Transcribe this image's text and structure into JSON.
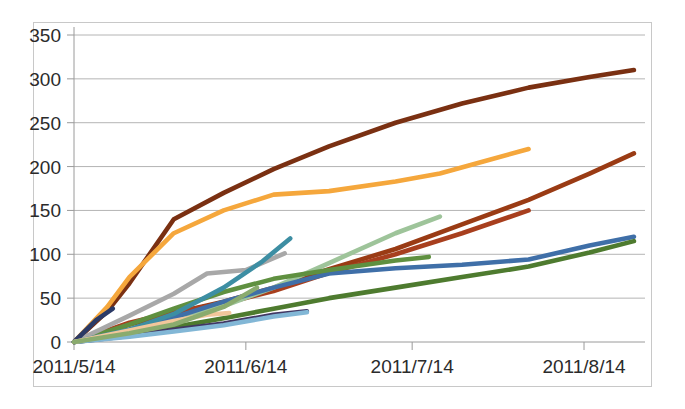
{
  "chart_data": {
    "type": "line",
    "title": "",
    "subtitle": "",
    "xlabel": "",
    "ylabel": "",
    "legend": "none",
    "grid": true,
    "x_tick_labels": [
      "2011/5/14",
      "2011/6/14",
      "2011/7/14",
      "2011/8/14"
    ],
    "x_tick_days": [
      0,
      31,
      61,
      92
    ],
    "xlim_days": [
      0,
      103
    ],
    "y_tick_labels": [
      "0",
      "50",
      "100",
      "150",
      "200",
      "250",
      "300",
      "350"
    ],
    "y_ticks": [
      0,
      50,
      100,
      150,
      200,
      250,
      300,
      350
    ],
    "ylim": [
      0,
      350
    ],
    "series": [
      {
        "name": "series-1-dark-brown",
        "color": "#7a3012",
        "x": [
          0,
          6,
          10,
          18,
          27,
          36,
          46,
          58,
          70,
          82,
          93,
          101
        ],
        "values": [
          0,
          35,
          67,
          140,
          170,
          197,
          223,
          250,
          272,
          290,
          302,
          310
        ]
      },
      {
        "name": "series-2-orange",
        "color": "#f5a73c",
        "x": [
          0,
          6,
          10,
          18,
          27,
          36,
          46,
          58,
          66,
          74,
          82
        ],
        "values": [
          0,
          40,
          74,
          124,
          150,
          168,
          172,
          183,
          192,
          206,
          220
        ]
      },
      {
        "name": "series-3-medium-brown",
        "color": "#9a3b14",
        "x": [
          0,
          10,
          18,
          27,
          36,
          46,
          58,
          70,
          82,
          93,
          101
        ],
        "values": [
          0,
          20,
          33,
          46,
          62,
          83,
          106,
          134,
          162,
          192,
          215
        ]
      },
      {
        "name": "series-4-red-brown",
        "color": "#a83f1e",
        "x": [
          0,
          10,
          18,
          27,
          36,
          46,
          58,
          70,
          82
        ],
        "values": [
          0,
          22,
          34,
          44,
          58,
          79,
          100,
          124,
          150
        ]
      },
      {
        "name": "series-5-light-green",
        "color": "#9ec49a",
        "x": [
          0,
          10,
          18,
          27,
          36,
          46,
          58,
          66
        ],
        "values": [
          0,
          14,
          26,
          41,
          62,
          90,
          124,
          143
        ]
      },
      {
        "name": "series-6-steel-blue",
        "color": "#3f6fa8",
        "x": [
          0,
          10,
          18,
          27,
          36,
          46,
          58,
          70,
          82,
          93,
          101
        ],
        "values": [
          0,
          14,
          28,
          46,
          62,
          78,
          84,
          88,
          94,
          110,
          120
        ]
      },
      {
        "name": "series-7-dark-green",
        "color": "#4e7b2f",
        "x": [
          0,
          10,
          18,
          27,
          36,
          46,
          58,
          70,
          82,
          93,
          101
        ],
        "values": [
          0,
          8,
          17,
          27,
          38,
          50,
          62,
          74,
          86,
          102,
          115
        ]
      },
      {
        "name": "series-8-medium-green",
        "color": "#5f9040",
        "x": [
          0,
          10,
          18,
          27,
          36,
          46,
          58,
          64
        ],
        "values": [
          0,
          20,
          38,
          57,
          72,
          82,
          93,
          97
        ]
      },
      {
        "name": "series-9-gray",
        "color": "#a8a8a8",
        "x": [
          0,
          10,
          18,
          24,
          31,
          38
        ],
        "values": [
          0,
          30,
          55,
          78,
          82,
          101
        ]
      },
      {
        "name": "series-10-teal",
        "color": "#3d8ea3",
        "x": [
          0,
          10,
          18,
          27,
          34,
          39
        ],
        "values": [
          0,
          14,
          32,
          62,
          92,
          118
        ]
      },
      {
        "name": "series-11-dark-navy",
        "color": "#2b3a66",
        "x": [
          0,
          4,
          7
        ],
        "values": [
          0,
          25,
          38
        ]
      },
      {
        "name": "series-12-purple",
        "color": "#413763",
        "x": [
          0,
          10,
          18,
          27,
          36,
          42
        ],
        "values": [
          0,
          7,
          14,
          21,
          31,
          35
        ]
      },
      {
        "name": "series-13-light-blue",
        "color": "#82b7d6",
        "x": [
          0,
          10,
          18,
          27,
          36,
          42
        ],
        "values": [
          0,
          6,
          12,
          19,
          29,
          34
        ]
      },
      {
        "name": "series-14-peach",
        "color": "#f2c69b",
        "x": [
          0,
          10,
          18,
          24,
          28
        ],
        "values": [
          0,
          13,
          24,
          31,
          33
        ]
      },
      {
        "name": "series-15-sage",
        "color": "#8aab6e",
        "x": [
          0,
          10,
          18,
          27,
          33
        ],
        "values": [
          0,
          10,
          20,
          40,
          62
        ]
      }
    ]
  },
  "colors": {
    "plot_border": "#c8c8c8",
    "gridline": "#b4b4b4",
    "axis": "#9a9a9a",
    "tick_text": "#2b2b2b",
    "background": "#ffffff"
  }
}
